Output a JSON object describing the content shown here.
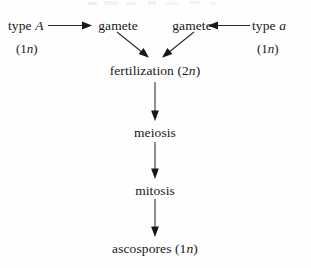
{
  "diagram": {
    "background_color": "#fefefe",
    "ink_color": "#17171a",
    "nodes": {
      "type_a_upper": {
        "prefix": "type ",
        "symbol": "A",
        "ploidy": "(1",
        "ploidy_var": "n",
        "ploidy_close": ")"
      },
      "type_a_lower": {
        "prefix": "type ",
        "symbol": "a",
        "ploidy": "(1",
        "ploidy_var": "n",
        "ploidy_close": ")"
      },
      "gamete_left": {
        "label": "gamete"
      },
      "gamete_right": {
        "label": "gamete"
      },
      "fertilization": {
        "label": "fertilization (2",
        "var": "n",
        "close": ")"
      },
      "meiosis": {
        "label": "meiosis"
      },
      "mitosis": {
        "label": "mitosis"
      },
      "ascospores": {
        "label": "ascospores (1",
        "var": "n",
        "close": ")"
      }
    },
    "edges": [
      {
        "name": "type-A-to-gamete-left",
        "direction": "right"
      },
      {
        "name": "type-a-to-gamete-right",
        "direction": "left"
      },
      {
        "name": "gamete-left-to-fertilization",
        "direction": "down-right"
      },
      {
        "name": "gamete-right-to-fertilization",
        "direction": "down-left"
      },
      {
        "name": "fertilization-to-meiosis",
        "direction": "down"
      },
      {
        "name": "meiosis-to-mitosis",
        "direction": "down"
      },
      {
        "name": "mitosis-to-ascospores",
        "direction": "down"
      }
    ]
  }
}
